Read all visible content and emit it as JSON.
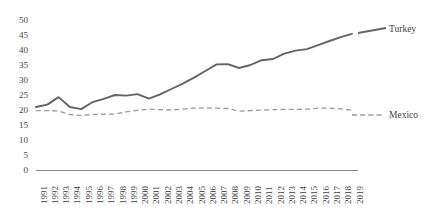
{
  "chart_data": {
    "type": "line",
    "title": "",
    "xlabel": "",
    "ylabel": "",
    "ylim": [
      0,
      50
    ],
    "ytick_step": 5,
    "yticks": [
      "50",
      "45",
      "40",
      "35",
      "30",
      "25",
      "20",
      "15",
      "10",
      "5",
      "0"
    ],
    "grid": false,
    "legend_position": "right-inline",
    "categories": [
      "1991",
      "1992",
      "1993",
      "1994",
      "1995",
      "1996",
      "1997",
      "1998",
      "1999",
      "2000",
      "2001",
      "2002",
      "2003",
      "2004",
      "2005",
      "2006",
      "2007",
      "2008",
      "2009",
      "2010",
      "2011",
      "2012",
      "2013",
      "2014",
      "2015",
      "2016",
      "2017",
      "2018",
      "2019"
    ],
    "series": [
      {
        "name": "Turkey",
        "color": "#646464",
        "style": "solid",
        "values": [
          21.0,
          21.8,
          24.3,
          21.0,
          20.3,
          22.6,
          23.7,
          25.0,
          24.8,
          25.3,
          23.8,
          25.2,
          27.0,
          28.8,
          30.8,
          33.0,
          35.2,
          35.3,
          34.0,
          35.0,
          36.6,
          37.0,
          38.8,
          39.8,
          40.3,
          41.6,
          43.0,
          44.3,
          45.4
        ]
      },
      {
        "name": "Mexico",
        "color": "#9a9a9a",
        "style": "dashed",
        "values": [
          19.8,
          19.8,
          19.7,
          18.5,
          18.2,
          18.5,
          18.6,
          18.6,
          19.4,
          19.9,
          20.3,
          20.1,
          20.0,
          20.3,
          20.6,
          20.7,
          20.6,
          20.5,
          19.6,
          19.8,
          20.0,
          20.1,
          20.2,
          20.2,
          20.3,
          20.6,
          20.6,
          20.4,
          19.9
        ]
      }
    ]
  },
  "labels": {
    "turkey": "Turkey",
    "mexico": "Mexico"
  }
}
